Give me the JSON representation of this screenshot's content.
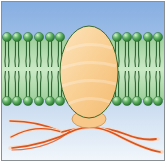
{
  "diagram": {
    "type": "membrane-protein-illustration",
    "colors": {
      "frame": "#8a8f94",
      "background_top": "#8fb3e3",
      "background_bottom": "#eef4fb",
      "bilayer_band": "#a9d6a6",
      "lipid_head": "#3f9a48",
      "lipid_head_highlight": "#b9e5b4",
      "lipid_tail": "#1f5a25",
      "protein_fill": "#f8c98a",
      "protein_fill_light": "#fde2b8",
      "protein_outline": "#3c6a2c",
      "filament": "#d9541e",
      "filament_light": "#f2b58c"
    },
    "bilayer": {
      "left_head_x": [
        7,
        17,
        28,
        39,
        50,
        60
      ],
      "right_head_x": [
        117,
        127,
        137,
        148,
        158
      ],
      "top_head_y": 37,
      "bottom_head_y": 101,
      "head_radius": 4.6
    },
    "protein": {
      "cx": 89,
      "cy": 72,
      "rx": 29,
      "ry": 46,
      "foot": {
        "cx": 89,
        "cy": 119,
        "rx": 17,
        "ry": 9
      }
    },
    "labels": []
  }
}
